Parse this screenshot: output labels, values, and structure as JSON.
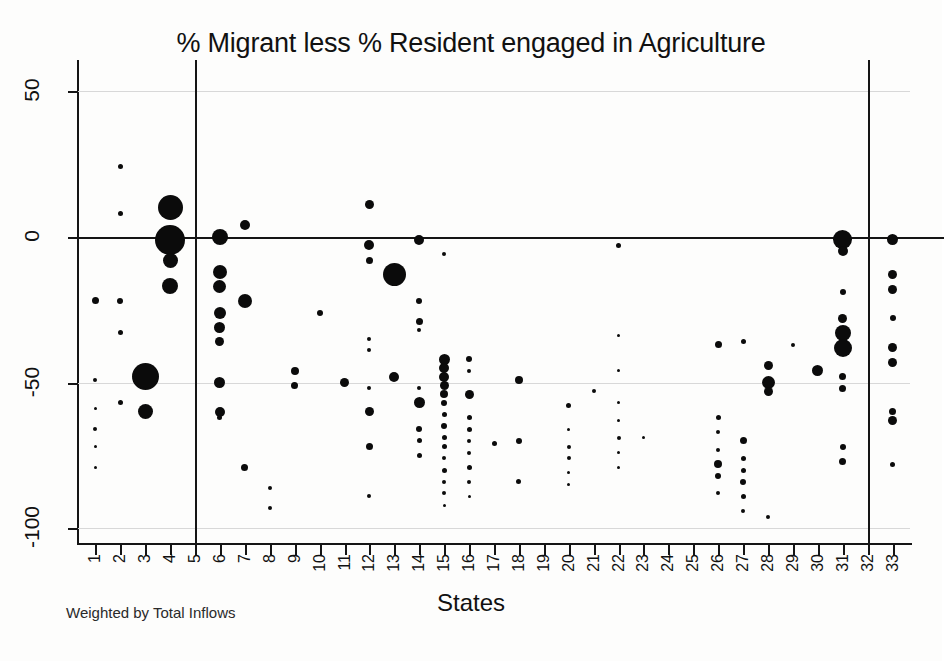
{
  "chart_data": {
    "type": "scatter",
    "title": "% Migrant less % Resident engaged in Agriculture",
    "subtitle": "",
    "xlabel": "States",
    "ylabel": "",
    "footnote": "Weighted by Total Inflows",
    "note": "Bubble scatter; marker area weighted by Total Inflows",
    "xlim": [
      0.3,
      33.7
    ],
    "ylim": [
      -105,
      52
    ],
    "yticks": [
      50,
      0,
      -50,
      -100
    ],
    "ytick_labels": [
      "50",
      "0",
      "-50",
      "-100"
    ],
    "xticks": [
      1,
      2,
      3,
      4,
      5,
      6,
      7,
      8,
      9,
      10,
      11,
      12,
      13,
      14,
      15,
      16,
      17,
      18,
      19,
      20,
      21,
      22,
      23,
      24,
      25,
      26,
      27,
      28,
      29,
      30,
      31,
      32,
      33
    ],
    "xtick_labels": [
      "1",
      "2",
      "3",
      "4",
      "5",
      "6",
      "7",
      "8",
      "9",
      "10",
      "11",
      "12",
      "13",
      "14",
      "15",
      "16",
      "17",
      "18",
      "19",
      "20",
      "21",
      "22",
      "23",
      "24",
      "25",
      "26",
      "27",
      "28",
      "29",
      "30",
      "31",
      "32",
      "33"
    ],
    "grid": true,
    "gridlines_y": [
      50,
      0,
      -50,
      -100
    ],
    "zero_line": 0,
    "reference_vlines": [
      5,
      32
    ],
    "legend": null,
    "marker_color": "#0b0b0b",
    "points": [
      {
        "x": 1,
        "y": -22,
        "w": 7
      },
      {
        "x": 1,
        "y": -49,
        "w": 4
      },
      {
        "x": 1,
        "y": -59,
        "w": 3
      },
      {
        "x": 1,
        "y": -66,
        "w": 4
      },
      {
        "x": 1,
        "y": -72,
        "w": 3
      },
      {
        "x": 1,
        "y": -79,
        "w": 3
      },
      {
        "x": 2,
        "y": 24,
        "w": 5
      },
      {
        "x": 2,
        "y": 8,
        "w": 5
      },
      {
        "x": 2,
        "y": -22,
        "w": 6
      },
      {
        "x": 2,
        "y": -33,
        "w": 5
      },
      {
        "x": 2,
        "y": -57,
        "w": 5
      },
      {
        "x": 3,
        "y": -48,
        "w": 27
      },
      {
        "x": 3,
        "y": -60,
        "w": 15
      },
      {
        "x": 4,
        "y": 10,
        "w": 25
      },
      {
        "x": 4,
        "y": -1,
        "w": 30
      },
      {
        "x": 4,
        "y": -8,
        "w": 15
      },
      {
        "x": 4,
        "y": -17,
        "w": 16
      },
      {
        "x": 6,
        "y": 0,
        "w": 16
      },
      {
        "x": 6,
        "y": -12,
        "w": 14
      },
      {
        "x": 6,
        "y": -17,
        "w": 13
      },
      {
        "x": 6,
        "y": -26,
        "w": 12
      },
      {
        "x": 6,
        "y": -31,
        "w": 11
      },
      {
        "x": 6,
        "y": -36,
        "w": 9
      },
      {
        "x": 6,
        "y": -50,
        "w": 11
      },
      {
        "x": 6,
        "y": -60,
        "w": 10
      },
      {
        "x": 6,
        "y": -62,
        "w": 5
      },
      {
        "x": 7,
        "y": 4,
        "w": 10
      },
      {
        "x": 7,
        "y": -22,
        "w": 14
      },
      {
        "x": 7,
        "y": -79,
        "w": 7
      },
      {
        "x": 8,
        "y": -86,
        "w": 4
      },
      {
        "x": 8,
        "y": -93,
        "w": 4
      },
      {
        "x": 9,
        "y": -46,
        "w": 8
      },
      {
        "x": 9,
        "y": -51,
        "w": 7
      },
      {
        "x": 10,
        "y": -26,
        "w": 6
      },
      {
        "x": 11,
        "y": -50,
        "w": 9
      },
      {
        "x": 12,
        "y": 11,
        "w": 9
      },
      {
        "x": 12,
        "y": -3,
        "w": 10
      },
      {
        "x": 12,
        "y": -8,
        "w": 7
      },
      {
        "x": 12,
        "y": -35,
        "w": 4
      },
      {
        "x": 12,
        "y": -39,
        "w": 4
      },
      {
        "x": 12,
        "y": -52,
        "w": 4
      },
      {
        "x": 12,
        "y": -60,
        "w": 9
      },
      {
        "x": 12,
        "y": -72,
        "w": 7
      },
      {
        "x": 12,
        "y": -89,
        "w": 4
      },
      {
        "x": 13,
        "y": -13,
        "w": 23
      },
      {
        "x": 13,
        "y": -48,
        "w": 10
      },
      {
        "x": 14,
        "y": -1,
        "w": 10
      },
      {
        "x": 14,
        "y": -22,
        "w": 6
      },
      {
        "x": 14,
        "y": -29,
        "w": 7
      },
      {
        "x": 14,
        "y": -32,
        "w": 4
      },
      {
        "x": 14,
        "y": -52,
        "w": 4
      },
      {
        "x": 14,
        "y": -57,
        "w": 11
      },
      {
        "x": 14,
        "y": -66,
        "w": 6
      },
      {
        "x": 14,
        "y": -70,
        "w": 5
      },
      {
        "x": 14,
        "y": -75,
        "w": 5
      },
      {
        "x": 15,
        "y": -6,
        "w": 4
      },
      {
        "x": 15,
        "y": -42,
        "w": 11
      },
      {
        "x": 15,
        "y": -45,
        "w": 10
      },
      {
        "x": 15,
        "y": -48,
        "w": 10
      },
      {
        "x": 15,
        "y": -51,
        "w": 9
      },
      {
        "x": 15,
        "y": -54,
        "w": 8
      },
      {
        "x": 15,
        "y": -57,
        "w": 6
      },
      {
        "x": 15,
        "y": -61,
        "w": 5
      },
      {
        "x": 15,
        "y": -65,
        "w": 6
      },
      {
        "x": 15,
        "y": -69,
        "w": 5
      },
      {
        "x": 15,
        "y": -72,
        "w": 5
      },
      {
        "x": 15,
        "y": -76,
        "w": 4
      },
      {
        "x": 15,
        "y": -80,
        "w": 5
      },
      {
        "x": 15,
        "y": -84,
        "w": 4
      },
      {
        "x": 15,
        "y": -88,
        "w": 4
      },
      {
        "x": 15,
        "y": -92,
        "w": 3
      },
      {
        "x": 16,
        "y": -42,
        "w": 6
      },
      {
        "x": 16,
        "y": -46,
        "w": 4
      },
      {
        "x": 16,
        "y": -54,
        "w": 9
      },
      {
        "x": 16,
        "y": -62,
        "w": 5
      },
      {
        "x": 16,
        "y": -66,
        "w": 5
      },
      {
        "x": 16,
        "y": -70,
        "w": 4
      },
      {
        "x": 16,
        "y": -74,
        "w": 4
      },
      {
        "x": 16,
        "y": -79,
        "w": 5
      },
      {
        "x": 16,
        "y": -84,
        "w": 4
      },
      {
        "x": 16,
        "y": -89,
        "w": 3
      },
      {
        "x": 17,
        "y": -71,
        "w": 5
      },
      {
        "x": 18,
        "y": -49,
        "w": 8
      },
      {
        "x": 18,
        "y": -70,
        "w": 6
      },
      {
        "x": 18,
        "y": -84,
        "w": 5
      },
      {
        "x": 20,
        "y": -58,
        "w": 5
      },
      {
        "x": 20,
        "y": -66,
        "w": 3
      },
      {
        "x": 20,
        "y": -72,
        "w": 4
      },
      {
        "x": 20,
        "y": -76,
        "w": 4
      },
      {
        "x": 20,
        "y": -81,
        "w": 3
      },
      {
        "x": 20,
        "y": -85,
        "w": 3
      },
      {
        "x": 21,
        "y": -53,
        "w": 4
      },
      {
        "x": 22,
        "y": -3,
        "w": 5
      },
      {
        "x": 22,
        "y": -34,
        "w": 3
      },
      {
        "x": 22,
        "y": -46,
        "w": 3
      },
      {
        "x": 22,
        "y": -57,
        "w": 3
      },
      {
        "x": 22,
        "y": -63,
        "w": 3
      },
      {
        "x": 22,
        "y": -69,
        "w": 4
      },
      {
        "x": 22,
        "y": -74,
        "w": 3
      },
      {
        "x": 22,
        "y": -79,
        "w": 3
      },
      {
        "x": 23,
        "y": -69,
        "w": 3
      },
      {
        "x": 26,
        "y": -37,
        "w": 7
      },
      {
        "x": 26,
        "y": -62,
        "w": 5
      },
      {
        "x": 26,
        "y": -67,
        "w": 4
      },
      {
        "x": 26,
        "y": -73,
        "w": 4
      },
      {
        "x": 26,
        "y": -78,
        "w": 8
      },
      {
        "x": 26,
        "y": -82,
        "w": 6
      },
      {
        "x": 26,
        "y": -88,
        "w": 4
      },
      {
        "x": 27,
        "y": -36,
        "w": 5
      },
      {
        "x": 27,
        "y": -70,
        "w": 7
      },
      {
        "x": 27,
        "y": -76,
        "w": 5
      },
      {
        "x": 27,
        "y": -80,
        "w": 5
      },
      {
        "x": 27,
        "y": -84,
        "w": 6
      },
      {
        "x": 27,
        "y": -89,
        "w": 5
      },
      {
        "x": 27,
        "y": -94,
        "w": 4
      },
      {
        "x": 28,
        "y": -44,
        "w": 9
      },
      {
        "x": 28,
        "y": -50,
        "w": 13
      },
      {
        "x": 28,
        "y": -53,
        "w": 9
      },
      {
        "x": 28,
        "y": -96,
        "w": 4
      },
      {
        "x": 29,
        "y": -37,
        "w": 4
      },
      {
        "x": 30,
        "y": -46,
        "w": 11
      },
      {
        "x": 31,
        "y": -1,
        "w": 19
      },
      {
        "x": 31,
        "y": -5,
        "w": 10
      },
      {
        "x": 31,
        "y": -19,
        "w": 6
      },
      {
        "x": 31,
        "y": -28,
        "w": 9
      },
      {
        "x": 31,
        "y": -33,
        "w": 16
      },
      {
        "x": 31,
        "y": -38,
        "w": 18
      },
      {
        "x": 31,
        "y": -48,
        "w": 7
      },
      {
        "x": 31,
        "y": -52,
        "w": 7
      },
      {
        "x": 31,
        "y": -72,
        "w": 6
      },
      {
        "x": 31,
        "y": -77,
        "w": 7
      },
      {
        "x": 33,
        "y": -1,
        "w": 11
      },
      {
        "x": 33,
        "y": -13,
        "w": 9
      },
      {
        "x": 33,
        "y": -18,
        "w": 9
      },
      {
        "x": 33,
        "y": -28,
        "w": 6
      },
      {
        "x": 33,
        "y": -38,
        "w": 9
      },
      {
        "x": 33,
        "y": -43,
        "w": 9
      },
      {
        "x": 33,
        "y": -60,
        "w": 7
      },
      {
        "x": 33,
        "y": -63,
        "w": 9
      },
      {
        "x": 33,
        "y": -78,
        "w": 5
      }
    ]
  }
}
